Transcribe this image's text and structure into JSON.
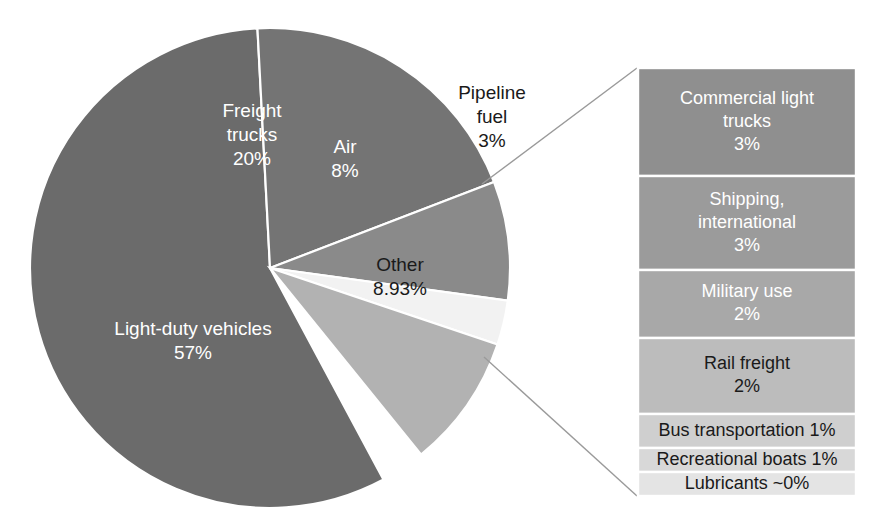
{
  "chart_data": {
    "type": "pie",
    "title": "",
    "subtitle": "",
    "xlabel": "",
    "ylabel": "",
    "legend_position": "none",
    "grid": false,
    "units": "percent",
    "categories": [
      "Light-duty vehicles",
      "Freight trucks",
      "Air",
      "Pipeline fuel",
      "Other"
    ],
    "values": [
      57,
      20,
      8,
      3,
      8.93
    ],
    "labels": [
      "57%",
      "20%",
      "8%",
      "3%",
      "8.93%"
    ],
    "colors": [
      "#6b6b6b",
      "#747474",
      "#8a8a8a",
      "#f2f2f2",
      "#b2b2b2"
    ],
    "breakout_of": "Other",
    "breakout": {
      "type": "stacked_bar",
      "categories": [
        "Commercial light trucks",
        "Shipping, international",
        "Military use",
        "Rail freight",
        "Bus transportation",
        "Recreational boats",
        "Lubricants"
      ],
      "values": [
        3,
        3,
        2,
        2,
        1,
        1,
        0
      ],
      "labels": [
        "3%",
        "3%",
        "2%",
        "2%",
        "1%",
        "1%",
        "~0%"
      ],
      "colors": [
        "#8f8f8f",
        "#9b9b9b",
        "#a8a8a8",
        "#bcbcbc",
        "#cfcfcf",
        "#d8d8d8",
        "#e4e4e4"
      ]
    }
  },
  "pie": {
    "slices": [
      {
        "name": "light-duty-vehicles",
        "label": "Light-duty vehicles",
        "value_label": "57%",
        "value": 57,
        "color": "#6b6b6b",
        "text_color": "light",
        "start_deg": 93,
        "end_deg": 298.2,
        "label_x": 193,
        "label_y": 342
      },
      {
        "name": "freight-trucks",
        "label": "Freight trucks",
        "value_label": "20%",
        "value": 20,
        "color": "#747474",
        "text_color": "light",
        "start_deg": 21,
        "end_deg": 93,
        "label_x": 252,
        "label_y": 136
      },
      {
        "name": "air",
        "label": "Air",
        "value_label": "8%",
        "value": 8,
        "color": "#8a8a8a",
        "text_color": "light",
        "start_deg": -7.8,
        "end_deg": 21,
        "label_x": 345,
        "label_y": 160
      },
      {
        "name": "pipeline-fuel",
        "label": "Pipeline fuel",
        "value_label": "3%",
        "value": 3,
        "color": "#f2f2f2",
        "text_color": "dark",
        "start_deg": -18.6,
        "end_deg": -7.8,
        "label_x": 492,
        "label_y": 118
      },
      {
        "name": "other",
        "label": "Other",
        "value_label": "8.93%",
        "value": 8.93,
        "color": "#b2b2b2",
        "text_color": "dark",
        "start_deg": -51,
        "end_deg": -18.6,
        "label_x": 400,
        "label_y": 278
      }
    ],
    "geometry": {
      "cx": 270,
      "cy": 268,
      "r": 240
    }
  },
  "breakout_bar": {
    "geometry": {
      "x": 638,
      "y": 68,
      "width": 218,
      "bottom": 496
    },
    "segments": [
      {
        "name": "commercial-light-trucks",
        "lines": [
          "Commercial light",
          "trucks",
          "3%"
        ],
        "label": "Commercial light trucks",
        "value_label": "3%",
        "value": 3,
        "color": "#8f8f8f",
        "text_color": "light",
        "y0": 68,
        "y1": 176
      },
      {
        "name": "shipping-international",
        "lines": [
          "Shipping,",
          "international",
          "3%"
        ],
        "label": "Shipping, international",
        "value_label": "3%",
        "value": 3,
        "color": "#9b9b9b",
        "text_color": "light",
        "y0": 176,
        "y1": 270
      },
      {
        "name": "military-use",
        "lines": [
          "Military use",
          "2%"
        ],
        "label": "Military use",
        "value_label": "2%",
        "value": 2,
        "color": "#a8a8a8",
        "text_color": "light",
        "y0": 270,
        "y1": 338
      },
      {
        "name": "rail-freight",
        "lines": [
          "Rail freight",
          "2%"
        ],
        "label": "Rail freight",
        "value_label": "2%",
        "value": 2,
        "color": "#bcbcbc",
        "text_color": "dark",
        "y0": 338,
        "y1": 414
      },
      {
        "name": "bus-transportation",
        "lines": [
          "Bus transportation 1%"
        ],
        "label": "Bus transportation",
        "value_label": "1%",
        "value": 1,
        "color": "#cfcfcf",
        "text_color": "dark",
        "y0": 414,
        "y1": 448
      },
      {
        "name": "recreational-boats",
        "lines": [
          "Recreational boats 1%"
        ],
        "label": "Recreational boats",
        "value_label": "1%",
        "value": 1,
        "color": "#d8d8d8",
        "text_color": "dark",
        "y0": 448,
        "y1": 472
      },
      {
        "name": "lubricants",
        "lines": [
          "Lubricants ~0%"
        ],
        "label": "Lubricants",
        "value_label": "~0%",
        "value": 0,
        "color": "#e4e4e4",
        "text_color": "dark",
        "y0": 472,
        "y1": 496
      }
    ]
  },
  "leader_lines": [
    {
      "name": "leader-top",
      "x1": 482,
      "y1": 184,
      "x2": 637,
      "y2": 68
    },
    {
      "name": "leader-bottom",
      "x1": 484,
      "y1": 357,
      "x2": 637,
      "y2": 496
    }
  ]
}
